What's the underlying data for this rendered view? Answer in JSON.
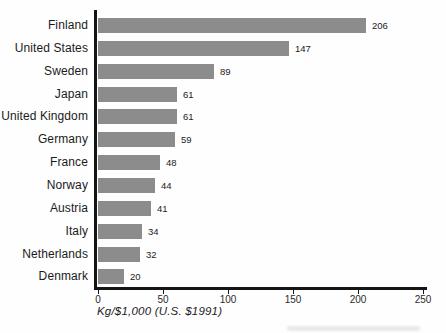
{
  "chart_data": {
    "type": "bar",
    "orientation": "horizontal",
    "title": "",
    "xlabel": "Kg/$1,000 (U.S. $1991)",
    "ylabel": "",
    "categories": [
      "Finland",
      "United States",
      "Sweden",
      "Japan",
      "United Kingdom",
      "Germany",
      "France",
      "Norway",
      "Austria",
      "Italy",
      "Netherlands",
      "Denmark"
    ],
    "values": [
      206,
      147,
      89,
      61,
      61,
      59,
      48,
      44,
      41,
      34,
      32,
      20
    ],
    "value_labels": [
      "206",
      "147",
      "89",
      "61",
      "61",
      "59",
      "48",
      "44",
      "41",
      "34",
      "32",
      "20"
    ],
    "xlim": [
      0,
      250
    ],
    "xticks": [
      0,
      50,
      100,
      150,
      200,
      250
    ],
    "xtick_labels": [
      "0",
      "50",
      "100",
      "150",
      "200",
      "250"
    ],
    "grid": false,
    "legend": "none",
    "bar_color": "#8c8c8c",
    "axis_color": "#151515",
    "label_color": "#1b1b1b"
  }
}
